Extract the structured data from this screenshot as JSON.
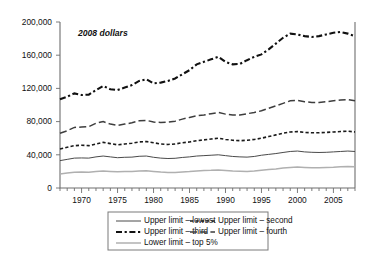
{
  "annotation": "2008 dollars",
  "legend": {
    "entries": [
      {
        "key": "lowest",
        "label": "Upper limit – lowest",
        "style": "solid-dark"
      },
      {
        "key": "second",
        "label": "Upper limit – second",
        "style": "fine-dash"
      },
      {
        "key": "third",
        "label": "Upper limit – third",
        "style": "dash-dot-heavy"
      },
      {
        "key": "fourth",
        "label": "Upper limit – fourth",
        "style": "long-dash"
      },
      {
        "key": "top5",
        "label": "Lower limit – top 5%",
        "style": "solid-light"
      }
    ]
  },
  "axes": {
    "y_ticks": [
      "0",
      "40,000",
      "80,000",
      "120,000",
      "160,000",
      "200,000"
    ],
    "y_min": 0,
    "y_max": 200000,
    "x_min": 1967,
    "x_max": 2008,
    "x_tick_labels": [
      "1970",
      "1975",
      "1980",
      "1985",
      "1990",
      "1995",
      "2000",
      "2005"
    ],
    "x_label_years": [
      1970,
      1975,
      1980,
      1985,
      1990,
      1995,
      2000,
      2005
    ],
    "xlabel": "",
    "ylabel": "",
    "grid": false
  },
  "colors": {
    "axis": "#6e6e6e",
    "third": "#111111",
    "fourth": "#3d3d3d",
    "second": "#1a1a1a",
    "lowest": "#4a4a4a",
    "top5": "#b0b0b0",
    "background": "#ffffff"
  },
  "chart_data": {
    "type": "line",
    "title": "",
    "subtitle": "",
    "xlabel": "",
    "ylabel": "",
    "annotation": "2008 dollars",
    "xlim": [
      1967,
      2008
    ],
    "ylim": [
      0,
      200000
    ],
    "grid": false,
    "legend_position": "bottom",
    "x": [
      1967,
      1968,
      1969,
      1970,
      1971,
      1972,
      1973,
      1974,
      1975,
      1976,
      1977,
      1978,
      1979,
      1980,
      1981,
      1982,
      1983,
      1984,
      1985,
      1986,
      1987,
      1988,
      1989,
      1990,
      1991,
      1992,
      1993,
      1994,
      1995,
      1996,
      1997,
      1998,
      1999,
      2000,
      2001,
      2002,
      2003,
      2004,
      2005,
      2006,
      2007,
      2008
    ],
    "series": [
      {
        "name": "Lower limit – top 5%",
        "legend_key": "third",
        "values": [
          107000,
          110000,
          114000,
          112000,
          112500,
          118000,
          123000,
          119000,
          118000,
          121000,
          124000,
          129000,
          131000,
          126000,
          127000,
          129000,
          132000,
          137000,
          142000,
          149000,
          152000,
          155000,
          158000,
          152000,
          149000,
          149500,
          154000,
          158000,
          161000,
          167000,
          174000,
          181000,
          186000,
          185000,
          183000,
          182000,
          183000,
          185000,
          187000,
          188000,
          186000,
          183000
        ]
      },
      {
        "name": "Upper limit – fourth",
        "legend_key": "fourth",
        "values": [
          66000,
          69000,
          73000,
          73500,
          74000,
          78000,
          80000,
          77000,
          75500,
          77000,
          78500,
          81000,
          81500,
          79500,
          79000,
          79500,
          80500,
          83000,
          85000,
          87000,
          88000,
          89500,
          91000,
          89000,
          88000,
          88000,
          89500,
          91000,
          93000,
          96000,
          99000,
          102000,
          105000,
          105500,
          104000,
          103000,
          103000,
          104000,
          105000,
          106000,
          106500,
          105000
        ]
      },
      {
        "name": "Upper limit – third",
        "legend_key": "second",
        "values": [
          47000,
          49000,
          51000,
          51500,
          51000,
          53000,
          55000,
          53500,
          52000,
          53000,
          54000,
          55500,
          56000,
          54500,
          53000,
          52500,
          53000,
          54500,
          55500,
          57000,
          58000,
          59000,
          60000,
          58500,
          57500,
          57000,
          57500,
          58500,
          60000,
          62000,
          64000,
          66000,
          67500,
          68000,
          67000,
          66500,
          66500,
          67000,
          67500,
          68000,
          68500,
          67500
        ]
      },
      {
        "name": "Upper limit – second",
        "legend_key": "lowest",
        "values": [
          33000,
          34500,
          36000,
          36200,
          36000,
          37500,
          38500,
          37500,
          36500,
          37000,
          37200,
          38200,
          38500,
          37000,
          36000,
          35500,
          35800,
          36800,
          37500,
          38500,
          39000,
          39500,
          40000,
          39000,
          38000,
          37500,
          37200,
          38000,
          39500,
          40500,
          41500,
          42800,
          44000,
          44500,
          43500,
          43000,
          42800,
          43000,
          43500,
          44000,
          44500,
          44000
        ]
      },
      {
        "name": "Upper limit – lowest",
        "legend_key": "top5",
        "values": [
          17000,
          18000,
          19000,
          19200,
          19000,
          19800,
          20500,
          20000,
          19500,
          19800,
          20000,
          20500,
          20800,
          20000,
          19200,
          18800,
          18800,
          19300,
          19800,
          20500,
          21000,
          21300,
          21800,
          21200,
          20500,
          20200,
          20000,
          20500,
          21500,
          22200,
          23000,
          24000,
          24800,
          25200,
          24800,
          24500,
          24500,
          24700,
          25000,
          25500,
          25800,
          25500
        ]
      }
    ]
  }
}
